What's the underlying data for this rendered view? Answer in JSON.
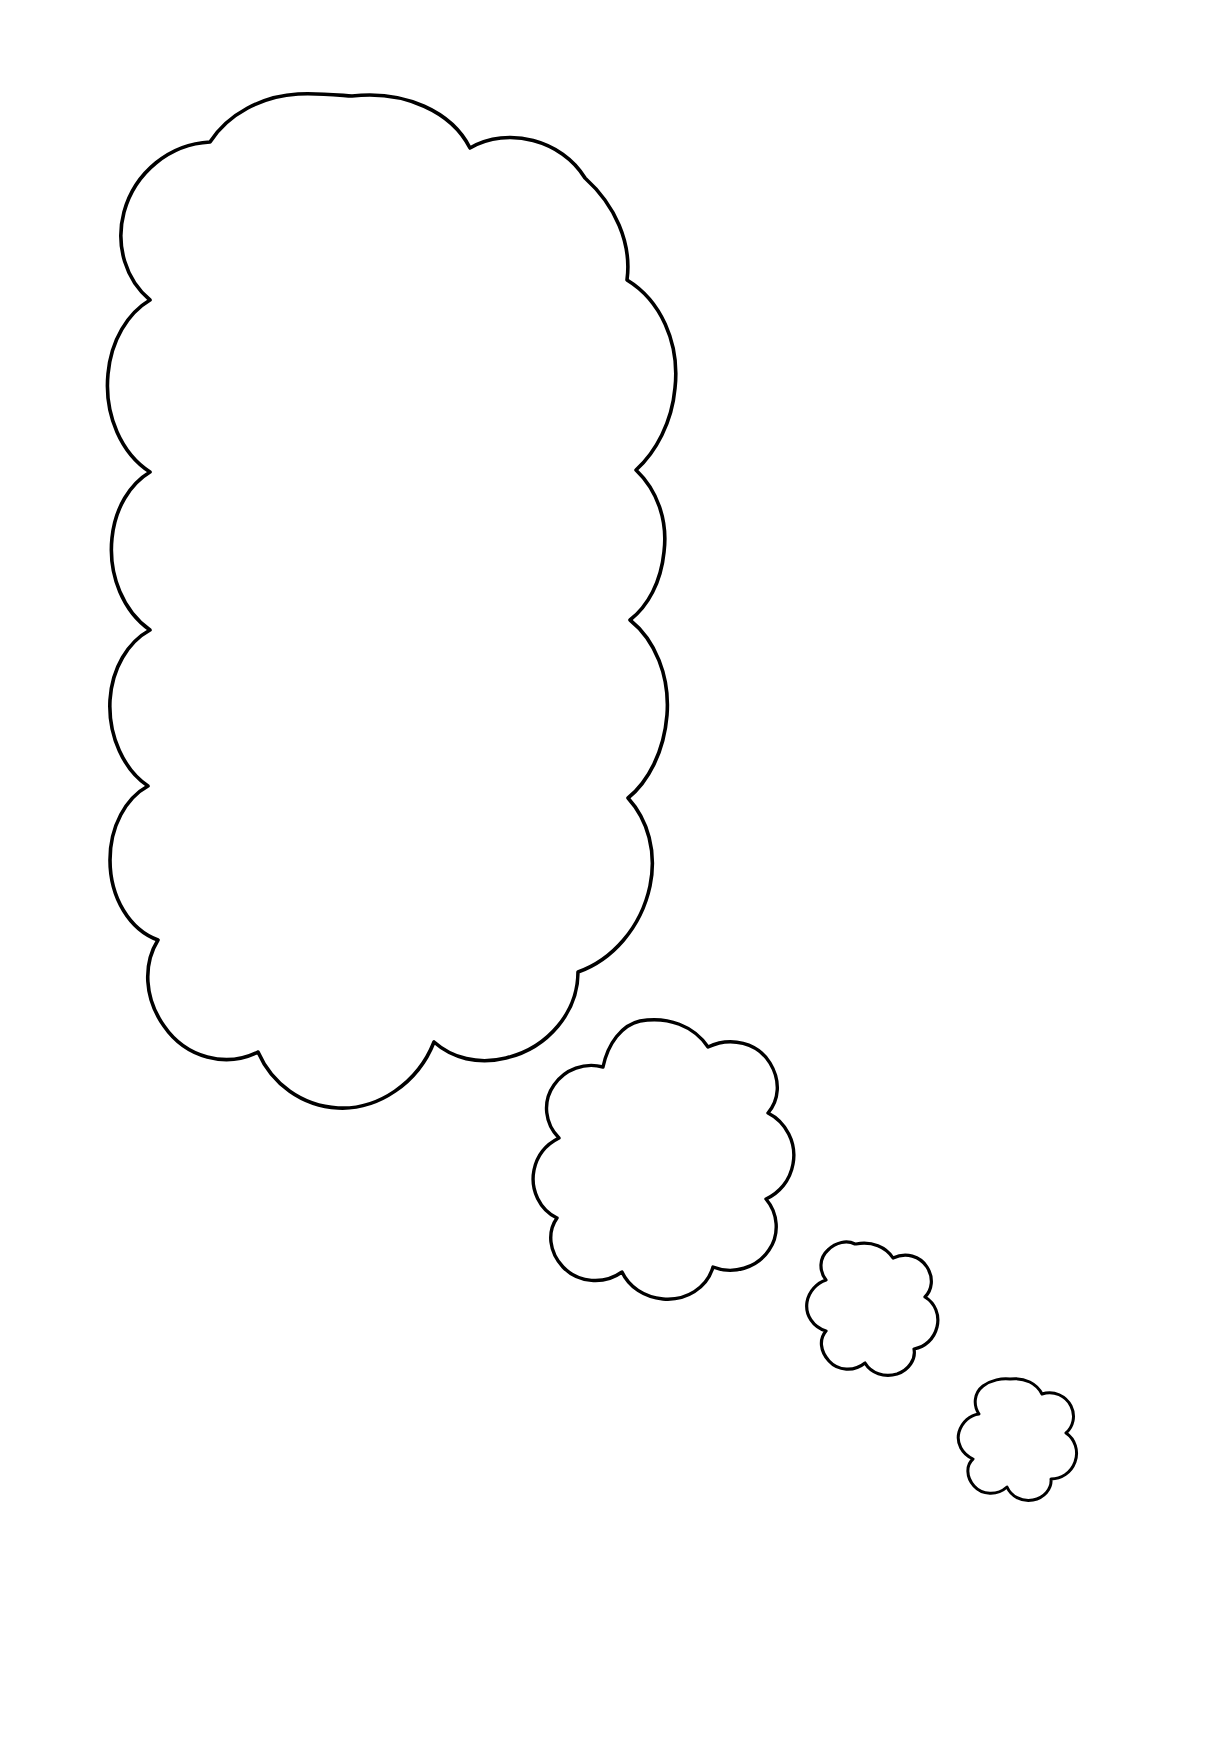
{
  "document": {
    "kind": "line-art-drawing",
    "subject": "thought-bubble",
    "page_width": 1229,
    "page_height": 1738,
    "background_color": "#ffffff",
    "stroke_color": "#000000",
    "fill_color": "#ffffff",
    "stroke_width": 3.5,
    "visible_text": "",
    "title_text": ""
  },
  "artwork": {
    "name": "thought-bubble-outline",
    "description": "Blank scalloped thought bubble with three trailing puffs, drawn as black outline on white, coloring-page style.",
    "shape_count": 4,
    "shapes": [
      {
        "id": "cloud-large",
        "label": "large thought bubble",
        "order": 1,
        "bounds": {
          "x": 58,
          "y": 93,
          "width": 690,
          "height": 1045
        },
        "center": {
          "x": 403,
          "y": 615
        },
        "lobe_count": 16,
        "stroke_width": 3.6
      },
      {
        "id": "cloud-medium",
        "label": "medium trailing puff",
        "order": 2,
        "bounds": {
          "x": 545,
          "y": 1018,
          "width": 215,
          "height": 235
        },
        "center": {
          "x": 652,
          "y": 1135
        },
        "lobe_count": 9,
        "stroke_width": 3.4
      },
      {
        "id": "cloud-small",
        "label": "small trailing puff",
        "order": 3,
        "bounds": {
          "x": 803,
          "y": 1242,
          "width": 117,
          "height": 120
        },
        "center": {
          "x": 861,
          "y": 1302
        },
        "lobe_count": 7,
        "stroke_width": 3.2
      },
      {
        "id": "cloud-tiny",
        "label": "smallest trailing puff",
        "order": 4,
        "bounds": {
          "x": 963,
          "y": 1377,
          "width": 100,
          "height": 108
        },
        "center": {
          "x": 1013,
          "y": 1431
        },
        "lobe_count": 6,
        "stroke_width": 3.0
      }
    ],
    "trail_direction": "upper-left to lower-right, decreasing size"
  }
}
